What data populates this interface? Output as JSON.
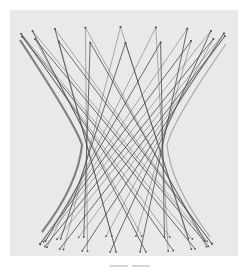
{
  "figure": {
    "background_color": "#e9e9e9",
    "line_color": "#4a4a4a",
    "silhouette_color": "#2a2a2a",
    "model": {
      "top_ellipse": {
        "cx": 123,
        "cy": 35,
        "rx": 103,
        "ry": 8
      },
      "bottom_ellipse": {
        "cx": 126,
        "cy": 244,
        "rx": 86,
        "ry": 8
      },
      "waist": {
        "y": 145,
        "x_left": 82,
        "x_right": 167
      },
      "strings_per_family": 18,
      "twist_degrees": 132,
      "families": 2
    }
  },
  "caption": {
    "legible": false
  }
}
